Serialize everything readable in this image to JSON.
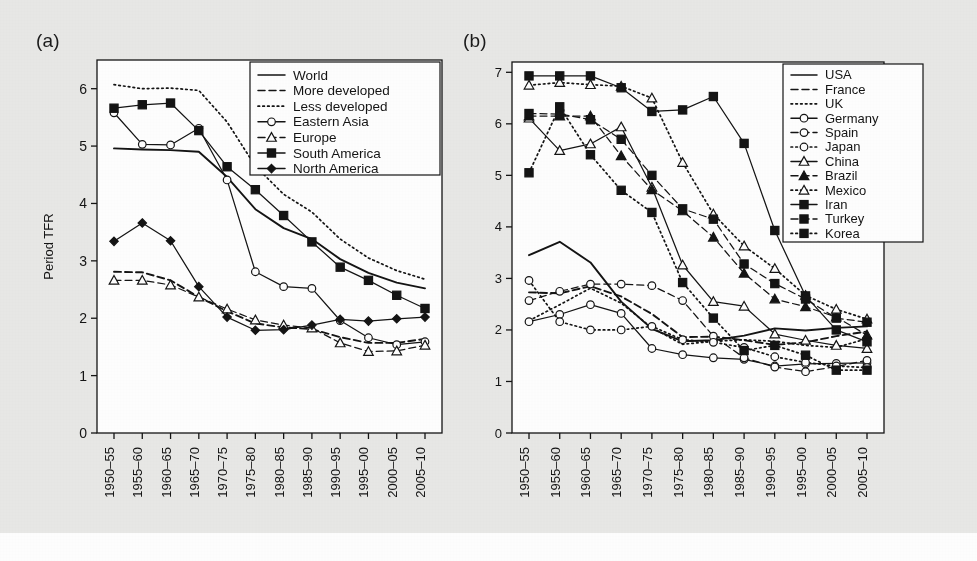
{
  "figure": {
    "background_color": "#e9e9e7",
    "plot_background_color": "#ffffff",
    "line_color": "#141414"
  },
  "panels": {
    "a": {
      "label": "(a)"
    },
    "b": {
      "label": "(b)"
    }
  },
  "chart_data": [
    {
      "id": "panel-a",
      "type": "line",
      "title": "(a)",
      "xlabel": "",
      "ylabel": "Period TFR",
      "ylim": [
        0,
        6.5
      ],
      "yticks": [
        0,
        1,
        2,
        3,
        4,
        5,
        6
      ],
      "ytick_labels": [
        "0",
        "1",
        "2",
        "3",
        "4",
        "5",
        "6"
      ],
      "grid": false,
      "legend_position": "top-right-inside",
      "categories": [
        "1950-55",
        "1955-60",
        "1960-65",
        "1965-70",
        "1970-75",
        "1975-80",
        "1980-85",
        "1985-90",
        "1990-95",
        "1995-00",
        "2000-05",
        "2005-10"
      ],
      "series": [
        {
          "name": "World",
          "style": "solid",
          "marker": "none",
          "values": [
            4.96,
            4.94,
            4.93,
            4.9,
            4.46,
            3.9,
            3.57,
            3.38,
            3.03,
            2.79,
            2.62,
            2.52
          ]
        },
        {
          "name": "More developed",
          "style": "dashed",
          "marker": "none",
          "values": [
            2.81,
            2.8,
            2.66,
            2.37,
            2.12,
            1.91,
            1.84,
            1.81,
            1.67,
            1.57,
            1.57,
            1.64
          ]
        },
        {
          "name": "Less developed",
          "style": "dotted",
          "marker": "none",
          "values": [
            6.07,
            6.0,
            6.01,
            5.97,
            5.42,
            4.65,
            4.16,
            3.85,
            3.38,
            3.05,
            2.83,
            2.68
          ]
        },
        {
          "name": "Eastern Asia",
          "style": "solid",
          "marker": "circle-open",
          "values": [
            5.58,
            5.03,
            5.02,
            5.31,
            4.41,
            2.81,
            2.55,
            2.52,
            1.96,
            1.66,
            1.54,
            1.59
          ]
        },
        {
          "name": "Europe",
          "style": "dashed",
          "marker": "triangle-open",
          "values": [
            2.66,
            2.66,
            2.58,
            2.37,
            2.16,
            1.97,
            1.88,
            1.83,
            1.57,
            1.42,
            1.43,
            1.53
          ]
        },
        {
          "name": "South America",
          "style": "solid",
          "marker": "square-filled",
          "values": [
            5.66,
            5.72,
            5.75,
            5.27,
            4.64,
            4.24,
            3.79,
            3.33,
            2.89,
            2.66,
            2.4,
            2.17
          ]
        },
        {
          "name": "North America",
          "style": "solid",
          "marker": "diamond-filled",
          "values": [
            3.34,
            3.66,
            3.35,
            2.55,
            2.02,
            1.79,
            1.8,
            1.88,
            1.98,
            1.95,
            1.99,
            2.02
          ]
        }
      ]
    },
    {
      "id": "panel-b",
      "type": "line",
      "title": "(b)",
      "xlabel": "",
      "ylabel": "",
      "ylim": [
        0,
        7.2
      ],
      "yticks": [
        0,
        1,
        2,
        3,
        4,
        5,
        6,
        7
      ],
      "ytick_labels": [
        "0",
        "1",
        "2",
        "3",
        "4",
        "5",
        "6",
        "7"
      ],
      "grid": false,
      "legend_position": "top-right-inside",
      "categories": [
        "1950-55",
        "1955-60",
        "1960-65",
        "1965-70",
        "1970-75",
        "1975-80",
        "1980-85",
        "1985-90",
        "1990-95",
        "1995-00",
        "2000-05",
        "2005-10"
      ],
      "series": [
        {
          "name": "USA",
          "style": "solid",
          "marker": "none",
          "values": [
            3.45,
            3.71,
            3.31,
            2.55,
            2.02,
            1.78,
            1.8,
            1.89,
            2.03,
            1.99,
            2.04,
            2.07
          ]
        },
        {
          "name": "France",
          "style": "dashed",
          "marker": "none",
          "values": [
            2.73,
            2.71,
            2.85,
            2.65,
            2.31,
            1.86,
            1.87,
            1.8,
            1.71,
            1.76,
            1.88,
            1.97
          ]
        },
        {
          "name": "UK",
          "style": "dotted",
          "marker": "none",
          "values": [
            2.18,
            2.49,
            2.81,
            2.52,
            2.04,
            1.72,
            1.78,
            1.81,
            1.78,
            1.7,
            1.66,
            1.83
          ]
        },
        {
          "name": "Germany",
          "style": "solid",
          "marker": "circle-open",
          "values": [
            2.16,
            2.3,
            2.49,
            2.32,
            1.64,
            1.52,
            1.46,
            1.43,
            1.3,
            1.34,
            1.35,
            1.36
          ]
        },
        {
          "name": "Spain",
          "style": "dashed",
          "marker": "circle-open",
          "values": [
            2.57,
            2.75,
            2.89,
            2.89,
            2.86,
            2.57,
            1.88,
            1.46,
            1.28,
            1.19,
            1.29,
            1.41
          ]
        },
        {
          "name": "Japan",
          "style": "dotted",
          "marker": "circle-open",
          "values": [
            2.96,
            2.16,
            2.0,
            2.0,
            2.07,
            1.81,
            1.76,
            1.66,
            1.48,
            1.37,
            1.3,
            1.27
          ]
        },
        {
          "name": "China",
          "style": "solid",
          "marker": "triangle-open",
          "values": [
            6.11,
            5.48,
            5.61,
            5.94,
            4.77,
            3.26,
            2.55,
            2.46,
            1.92,
            1.8,
            1.7,
            1.64
          ]
        },
        {
          "name": "Brazil",
          "style": "dashed",
          "marker": "triangle-filled",
          "values": [
            6.15,
            6.15,
            6.15,
            5.38,
            4.72,
            4.31,
            3.8,
            3.1,
            2.6,
            2.45,
            2.25,
            1.9
          ]
        },
        {
          "name": "Mexico",
          "style": "dotted",
          "marker": "triangle-open",
          "values": [
            6.75,
            6.8,
            6.76,
            6.73,
            6.5,
            5.25,
            4.25,
            3.63,
            3.19,
            2.67,
            2.4,
            2.21
          ]
        },
        {
          "name": "Iran",
          "style": "solid",
          "marker": "square-filled",
          "values": [
            6.93,
            6.93,
            6.93,
            6.7,
            6.24,
            6.27,
            6.53,
            5.62,
            3.93,
            2.66,
            2.0,
            1.77
          ]
        },
        {
          "name": "Turkey",
          "style": "dashed",
          "marker": "square-filled",
          "values": [
            6.2,
            6.19,
            6.08,
            5.7,
            5.0,
            4.35,
            4.15,
            3.28,
            2.9,
            2.6,
            2.23,
            2.15
          ]
        },
        {
          "name": "Korea",
          "style": "dotted",
          "marker": "square-filled",
          "values": [
            5.05,
            6.33,
            5.4,
            4.71,
            4.28,
            2.92,
            2.23,
            1.6,
            1.7,
            1.51,
            1.22,
            1.22
          ]
        }
      ]
    }
  ],
  "legend_a": {
    "items": [
      {
        "label": "World"
      },
      {
        "label": "More developed"
      },
      {
        "label": "Less developed"
      },
      {
        "label": "Eastern Asia"
      },
      {
        "label": "Europe"
      },
      {
        "label": "South America"
      },
      {
        "label": "North America"
      }
    ]
  },
  "legend_b": {
    "items": [
      {
        "label": "USA"
      },
      {
        "label": "France"
      },
      {
        "label": "UK"
      },
      {
        "label": "Germany"
      },
      {
        "label": "Spain"
      },
      {
        "label": "Japan"
      },
      {
        "label": "China"
      },
      {
        "label": "Brazil"
      },
      {
        "label": "Mexico"
      },
      {
        "label": "Iran"
      },
      {
        "label": "Turkey"
      },
      {
        "label": "Korea"
      }
    ]
  }
}
